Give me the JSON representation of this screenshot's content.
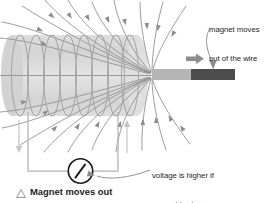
{
  "figure": {
    "caption": {
      "bullet_icon": "triangle-outline-icon",
      "text": "Magnet moves out"
    },
    "annotations": [
      {
        "id": "magnet-moves",
        "line1": "magnet moves",
        "line2": "out of the wire"
      },
      {
        "id": "voltage",
        "line1": "voltage is higher if",
        "line2": "magnet is stronger"
      }
    ],
    "parts": {
      "coil_label": "solenoid-coil",
      "magnet_label": "bar-magnet",
      "meter_label": "voltmeter",
      "motion_arrow_label": "magnet-motion-arrow",
      "current_arrow_left": "current-arrow-down",
      "current_arrow_right": "current-arrow-up"
    },
    "colors": {
      "background": "#ffffff",
      "text": "#231f20",
      "coil_body": "#d9d9d9",
      "coil_wire": "#a0a0a0",
      "field_line": "#8c8c8c",
      "magnet_north": "#b5b5b5",
      "magnet_south": "#4d4d4d",
      "circuit_wire": "#b3b3b3",
      "meter_outline": "#1a1a1a",
      "leader_line": "#8c8c8c",
      "motion_arrow": "#8c8c8c"
    }
  }
}
